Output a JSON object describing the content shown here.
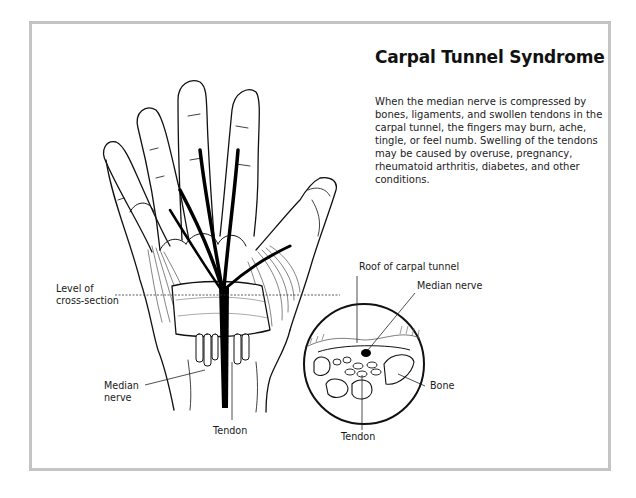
{
  "figure": {
    "title": "Carpal Tunnel Syndrome",
    "description_lines": [
      "When the median nerve is compressed by",
      "bones, ligaments, and swollen tendons in the",
      "carpal tunnel, the fingers may burn, ache,",
      "tingle, or feel numb. Swelling of the tendons",
      "may be caused by overuse, pregnancy,",
      "rheumatoid arthritis, diabetes, and other",
      "conditions."
    ],
    "colors": {
      "frame": "#c4c4c4",
      "line": "#111111",
      "nerve": "#000000",
      "text": "#1a1a1a"
    }
  },
  "hand_labels": {
    "level_line1": "Level of",
    "level_line2": "cross-section",
    "median_line1": "Median",
    "median_line2": "nerve",
    "tendon": "Tendon"
  },
  "cross_section_labels": {
    "roof": "Roof of carpal tunnel",
    "median_nerve": "Median nerve",
    "bone": "Bone",
    "tendon": "Tendon"
  }
}
